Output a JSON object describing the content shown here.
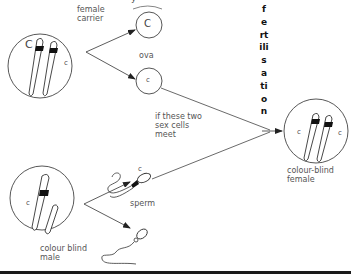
{
  "diagram": {
    "title_fragment": "y",
    "female_carrier": {
      "label": "female\ncarrier",
      "allele_left": "C",
      "allele_right": "c"
    },
    "ova": {
      "label": "ova",
      "top_allele": "C",
      "bottom_allele": "c"
    },
    "meeting_note": "if these two\nsex cells\nmeet",
    "fertilisation_label": "fertilisation",
    "colour_blind_female": {
      "label": "colour-blind\nfemale",
      "allele_left": "c",
      "allele_right": "c"
    },
    "colour_blind_male": {
      "label": "colour blind\nmale",
      "allele": "c"
    },
    "sperm": {
      "label": "sperm",
      "top_allele": "c"
    },
    "colors": {
      "stroke": "#333333",
      "band": "#111111",
      "text": "#555555",
      "bottom_bar": "#1a1a1a"
    }
  }
}
